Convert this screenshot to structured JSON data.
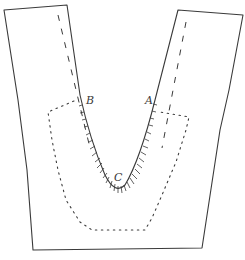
{
  "figure": {
    "type": "diagram",
    "colors": {
      "ink": "#3a3a3a",
      "background": "#ffffff"
    },
    "labels": [
      {
        "id": "B",
        "text": "B",
        "x": 87,
        "y": 95
      },
      {
        "id": "A",
        "text": "A",
        "x": 146,
        "y": 95
      },
      {
        "id": "C",
        "text": "C",
        "x": 114,
        "y": 172
      }
    ],
    "elements": {
      "outline": "solid outer pattern edge",
      "v_edge": "V-shaped inner edge from B through C to A with hachure/snip marks",
      "seam_lines": "two dashed guide lines along inner edges",
      "facing": "dotted U-shaped facing outline"
    }
  }
}
